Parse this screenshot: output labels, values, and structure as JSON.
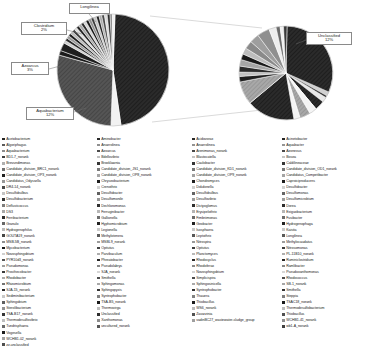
{
  "chart_data": {
    "type": "pie",
    "title": "",
    "subtitle": "",
    "xlabel": "",
    "ylabel": "",
    "variant": "pie-of-pie",
    "legend_position": "bottom",
    "grid": false,
    "annotations": [
      {
        "name": "Longilinea",
        "percent": "",
        "label": "Longilinea"
      },
      {
        "name": "Clostridium",
        "percent": "2%",
        "label": "Clostridium 2%"
      },
      {
        "name": "Azoarcus",
        "percent": "3%",
        "label": "Azoarcus 3%"
      },
      {
        "name": "Aquabacterium",
        "percent": "12%",
        "label": "Aquabacterium 12%"
      },
      {
        "name": "Unclassified",
        "percent": "12%",
        "label": "Unclassified 12%"
      }
    ],
    "main_pie": {
      "name": "Genus composition",
      "slices": [
        {
          "label": "Unclassified",
          "value": 35.0,
          "color": "#2b2b2b"
        },
        {
          "label": "Aquabacterium",
          "value": 12.0,
          "color": "#4d4d4d"
        },
        {
          "label": "Azoarcus",
          "value": 3.0,
          "color": "#1e1e1e"
        },
        {
          "label": "Clostridium",
          "value": 2.0,
          "color": "#9a9a9a"
        },
        {
          "label": "Longilinea",
          "value": 1.8,
          "color": "#d9d9d9"
        },
        {
          "label": "Other (expanded)",
          "value": 46.2,
          "color": "#bdbdbd"
        }
      ]
    },
    "secondary_pie": {
      "name": "Expanded minor genera",
      "slices": [
        {
          "label": "Unclassified",
          "value": 12.0,
          "color": "#2b2b2b"
        },
        {
          "label": "group-2",
          "value": 9.0,
          "color": "#8f8f8f"
        },
        {
          "label": "group-3",
          "value": 8.0,
          "color": "#3a3a3a"
        },
        {
          "label": "group-4",
          "value": 7.0,
          "color": "#b3b3b3"
        },
        {
          "label": "group-5",
          "value": 6.0,
          "color": "#5c5c5c"
        },
        {
          "label": "group-6",
          "value": 5.0,
          "color": "#a6a6a6"
        }
      ]
    }
  },
  "legend": {
    "columns": [
      {
        "items": [
          {
            "label": "Acetobacterium",
            "color": "#262626"
          },
          {
            "label": "Algoriphagus",
            "color": "#5a5a5a"
          },
          {
            "label": "Aquabacterium",
            "color": "#8c8c8c"
          },
          {
            "label": "BD1-7_norank",
            "color": "#3f3f3f"
          },
          {
            "label": "Brevundimonas",
            "color": "#b0b0b0"
          },
          {
            "label": "Candidate_division_BRC1_norank",
            "color": "#707070"
          },
          {
            "label": "Candidate_division_OP3_norank",
            "color": "#1f1f1f"
          },
          {
            "label": "Candidatus_Odyssella",
            "color": "#989898"
          },
          {
            "label": "DR4-14_norank",
            "color": "#4a4a4a"
          },
          {
            "label": "Desulfobulbus",
            "color": "#c4c4c4"
          },
          {
            "label": "Desulfobacterium",
            "color": "#333333"
          },
          {
            "label": "Defluviicoccus",
            "color": "#7d7d7d"
          },
          {
            "label": "DS3",
            "color": "#a8a8a8"
          },
          {
            "label": "Ferribacterium",
            "color": "#2e2e2e"
          },
          {
            "label": "Granulo",
            "color": "#666666"
          },
          {
            "label": "Hydrogenophilus",
            "color": "#bababa"
          },
          {
            "label": "GOUTA19_norank",
            "color": "#454545"
          },
          {
            "label": "MSB-5B_norank",
            "color": "#8f8f8f"
          },
          {
            "label": "Mycobacterium",
            "color": "#1a1a1a"
          },
          {
            "label": "Novosphingobium",
            "color": "#d0d0d0"
          },
          {
            "label": "PYR10d3_norank",
            "color": "#555555"
          },
          {
            "label": "Pseudomonas",
            "color": "#9e9e9e"
          },
          {
            "label": "Prosthecobacter",
            "color": "#3a3a3a"
          },
          {
            "label": "Rhodobacter",
            "color": "#ababab"
          },
          {
            "label": "Rhizomicrobium",
            "color": "#737373"
          },
          {
            "label": "SJA-15_norank",
            "color": "#282828"
          },
          {
            "label": "Sediminibacterium",
            "color": "#c8c8c8"
          },
          {
            "label": "Sphingobium",
            "color": "#5f5f5f"
          },
          {
            "label": "Sterolibacterium",
            "color": "#929292"
          },
          {
            "label": "TSA-B17_norank",
            "color": "#353535"
          },
          {
            "label": "Thermodesulfovibrio",
            "color": "#bfbfbf"
          },
          {
            "label": "Tundrisphaera",
            "color": "#6b6b6b"
          },
          {
            "label": "Vogesella",
            "color": "#1d1d1d"
          },
          {
            "label": "WCHB1-02_norank",
            "color": "#a3a3a3"
          },
          {
            "label": "zz-unclassified",
            "color": "#4f4f4f"
          }
        ]
      },
      {
        "items": [
          {
            "label": "Aminobacter",
            "color": "#2b2b2b"
          },
          {
            "label": "Anaerolinea",
            "color": "#909090"
          },
          {
            "label": "Azoarcus",
            "color": "#4b4b4b"
          },
          {
            "label": "Bdellovibrio",
            "color": "#c0c0c0"
          },
          {
            "label": "Brooklawnia",
            "color": "#383838"
          },
          {
            "label": "Candidate_division_JS1_norank",
            "color": "#7a7a7a"
          },
          {
            "label": "Candidate_division_OP8_norank",
            "color": "#a5a5a5"
          },
          {
            "label": "Chryseobacterium",
            "color": "#1e1e1e"
          },
          {
            "label": "Crenothrix",
            "color": "#d2d2d2"
          },
          {
            "label": "Desulfobacter",
            "color": "#606060"
          },
          {
            "label": "Desulfomonile",
            "color": "#979797"
          },
          {
            "label": "Dechloromonas",
            "color": "#303030"
          },
          {
            "label": "Ferruginibacter",
            "color": "#b7b7b7"
          },
          {
            "label": "Gallionella",
            "color": "#6e6e6e"
          },
          {
            "label": "Hyphomicrobium",
            "color": "#232323"
          },
          {
            "label": "Legionella",
            "color": "#cbcbcb"
          },
          {
            "label": "Methylotenera",
            "color": "#5a5a5a"
          },
          {
            "label": "MSBL9_norank",
            "color": "#9c9c9c"
          },
          {
            "label": "Opitutus",
            "color": "#424242"
          },
          {
            "label": "Parvibaculum",
            "color": "#aeaeae"
          },
          {
            "label": "Phreatobacter",
            "color": "#262626"
          },
          {
            "label": "Pseudolabrys",
            "color": "#848484"
          },
          {
            "label": "SJA_norank",
            "color": "#d6d6d6"
          },
          {
            "label": "Smithella",
            "color": "#4e4e4e"
          },
          {
            "label": "Sphingomonas",
            "color": "#a9a9a9"
          },
          {
            "label": "Sphingopyxis",
            "color": "#343434"
          },
          {
            "label": "Syntrophobacter",
            "color": "#7f7f7f"
          },
          {
            "label": "TSA-B5_norank",
            "color": "#1b1b1b"
          },
          {
            "label": "Thermovirga",
            "color": "#bebebe"
          },
          {
            "label": "Unclassified",
            "color": "#2f2f2f"
          },
          {
            "label": "Xanthomonas",
            "color": "#8b8b8b"
          },
          {
            "label": "uncultured_norank",
            "color": "#565656"
          }
        ]
      },
      {
        "items": [
          {
            "label": "Acidovorax",
            "color": "#2a2a2a"
          },
          {
            "label": "Anaerolinea",
            "color": "#939393"
          },
          {
            "label": "Arenimonas_norank",
            "color": "#474747"
          },
          {
            "label": "Blastocatella",
            "color": "#c3c3c3"
          },
          {
            "label": "Caulobacter",
            "color": "#353535"
          },
          {
            "label": "Candidate_division_KD1_norank",
            "color": "#777777"
          },
          {
            "label": "Candidate_division_OP9_norank",
            "color": "#a1a1a1"
          },
          {
            "label": "Chondromyces",
            "color": "#1f1f1f"
          },
          {
            "label": "Dokdonella",
            "color": "#cfcfcf"
          },
          {
            "label": "Desulfobulbus",
            "color": "#636363"
          },
          {
            "label": "Desulfovibrio",
            "color": "#9a9a9a"
          },
          {
            "label": "Dictyoglomus",
            "color": "#2d2d2d"
          },
          {
            "label": "Erysipelothrix",
            "color": "#b4b4b4"
          },
          {
            "label": "Fimbriimonas",
            "color": "#6a6a6a"
          },
          {
            "label": "Geobacter",
            "color": "#202020"
          },
          {
            "label": "Isosphaera",
            "color": "#c7c7c7"
          },
          {
            "label": "Leptothrix",
            "color": "#575757"
          },
          {
            "label": "Nitrospira",
            "color": "#999999"
          },
          {
            "label": "Opitutus",
            "color": "#3e3e3e"
          },
          {
            "label": "Planctomyces",
            "color": "#b9b9b9"
          },
          {
            "label": "Rhodocyclus",
            "color": "#292929"
          },
          {
            "label": "Rhodoferax",
            "color": "#888888"
          },
          {
            "label": "Novosphingobium",
            "color": "#d4d4d4"
          },
          {
            "label": "Simplicispira",
            "color": "#4c4c4c"
          },
          {
            "label": "Sphingosinicella",
            "color": "#aaaaaa"
          },
          {
            "label": "Syntrophobacter",
            "color": "#313131"
          },
          {
            "label": "Thauera",
            "color": "#818181"
          },
          {
            "label": "Thiobacillus",
            "color": "#1c1c1c"
          },
          {
            "label": "WS6_norank",
            "color": "#bcbcbc"
          },
          {
            "label": "Zavarzinia",
            "color": "#525252"
          },
          {
            "label": "vadinBC27_wastewater-sludge_group",
            "color": "#9f9f9f"
          }
        ]
      },
      {
        "items": [
          {
            "label": "Acinetobacter",
            "color": "#272727"
          },
          {
            "label": "Aquabacter",
            "color": "#959595"
          },
          {
            "label": "Azonexus",
            "color": "#494949"
          },
          {
            "label": "Bosea",
            "color": "#c5c5c5"
          },
          {
            "label": "Caldilineaceae",
            "color": "#373737"
          },
          {
            "label": "Candidate_division_OD1_norank",
            "color": "#797979"
          },
          {
            "label": "Candidatus_Competibacter",
            "color": "#a4a4a4"
          },
          {
            "label": "Caproiciproducens",
            "color": "#1d1d1d"
          },
          {
            "label": "Desulfobacter",
            "color": "#d1d1d1"
          },
          {
            "label": "Desulfomonas",
            "color": "#656565"
          },
          {
            "label": "Desulfomicrobium",
            "color": "#9b9b9b"
          },
          {
            "label": "Dorea",
            "color": "#2c2c2c"
          },
          {
            "label": "Exiguobacterium",
            "color": "#b6b6b6"
          },
          {
            "label": "Fusibacter",
            "color": "#6c6c6c"
          },
          {
            "label": "Hydrogenophaga",
            "color": "#222222"
          },
          {
            "label": "Kaistia",
            "color": "#c9c9c9"
          },
          {
            "label": "Longilinea",
            "color": "#595959"
          },
          {
            "label": "Methylocaudatus",
            "color": "#9d9d9d"
          },
          {
            "label": "Nitrosomonas",
            "color": "#3d3d3d"
          },
          {
            "label": "PL-11B10_norank",
            "color": "#afafaf"
          },
          {
            "label": "Ruminiclostridium",
            "color": "#252525"
          },
          {
            "label": "Ramlibacter",
            "color": "#868686"
          },
          {
            "label": "Pseudoxanthomonas",
            "color": "#d7d7d7"
          },
          {
            "label": "Rhodococcus",
            "color": "#4d4d4d"
          },
          {
            "label": "SB-1_norank",
            "color": "#a7a7a7"
          },
          {
            "label": "Smithella",
            "color": "#333333"
          },
          {
            "label": "Steppia",
            "color": "#7e7e7e"
          },
          {
            "label": "TSAC18_norank",
            "color": "#1a1a1a"
          },
          {
            "label": "Thermodesulfobacterium",
            "color": "#bdbdbd"
          },
          {
            "label": "Thiobacillus",
            "color": "#505050"
          },
          {
            "label": "WCHB1-41_norank",
            "color": "#8e8e8e"
          },
          {
            "label": "wb1-A_norank",
            "color": "#404040"
          }
        ]
      }
    ]
  }
}
